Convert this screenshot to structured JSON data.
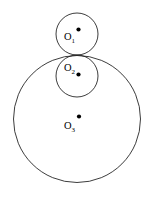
{
  "figure": {
    "background_color": "#ffffff",
    "stroke_color": "#1a1a1a",
    "marker_color": "#000000",
    "width": 150,
    "height": 197
  },
  "chart_data": {
    "type": "diagram",
    "subtype": "geometric-construction",
    "coordinate_space": {
      "units": "pixels",
      "origin": "top-left",
      "width": 150,
      "height": 197
    },
    "tangent_point": {
      "x": 77,
      "y": 55
    },
    "circles": [
      {
        "id": "O1",
        "label": "O",
        "subscript": "1",
        "cx": 77,
        "cy": 34,
        "r": 21,
        "label_x": 64,
        "label_y": 40,
        "dot_x": 78.5,
        "dot_y": 29.5,
        "dot_r": 2.1,
        "relation": "small circle above, externally tangent"
      },
      {
        "id": "O2",
        "label": "O",
        "subscript": "2",
        "cx": 77,
        "cy": 76,
        "r": 21,
        "label_x": 64,
        "label_y": 71,
        "dot_x": 78.5,
        "dot_y": 74.5,
        "dot_r": 2.1,
        "relation": "small circle inside large circle, internally tangent"
      },
      {
        "id": "O3",
        "label": "O",
        "subscript": "3",
        "cx": 77,
        "cy": 119,
        "r": 63.5,
        "label_x": 64,
        "label_y": 129,
        "dot_x": 79,
        "dot_y": 116.5,
        "dot_r": 2.1,
        "relation": "large enclosing circle"
      }
    ]
  }
}
